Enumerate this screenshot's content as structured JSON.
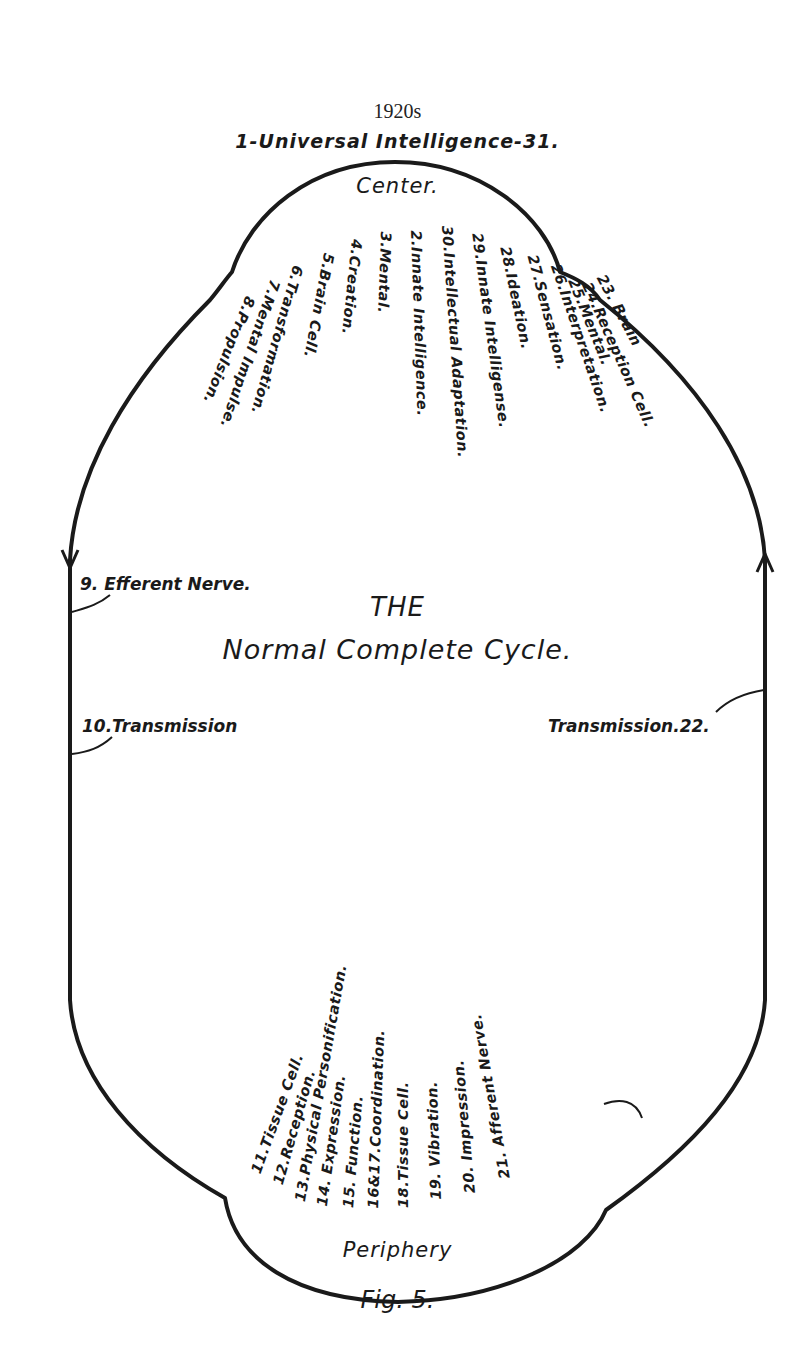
{
  "year_caption": "1920s",
  "header": "1-Universal Intelligence-31.",
  "center_label": "Center.",
  "title_line1": "THE",
  "title_line2": "Normal Complete Cycle.",
  "periphery_label": "Periphery",
  "figure_caption": "Fig. 5.",
  "center_steps": [
    {
      "label": "23. Brain",
      "x": 608,
      "y": 272,
      "angle": 62
    },
    {
      "label": "24.Reception Cell.",
      "x": 594,
      "y": 280,
      "angle": 66
    },
    {
      "label": "25.Mental.",
      "x": 580,
      "y": 276,
      "angle": 68
    },
    {
      "label": "26.Interpretation.",
      "x": 563,
      "y": 262,
      "angle": 71
    },
    {
      "label": "27.Sensation.",
      "x": 540,
      "y": 253,
      "angle": 75
    },
    {
      "label": "28.Ideation.",
      "x": 513,
      "y": 245,
      "angle": 78
    },
    {
      "label": "29.Innate Intelligense.",
      "x": 485,
      "y": 232,
      "angle": 82
    },
    {
      "label": "30.Intellectual Adaptation.",
      "x": 455,
      "y": 225,
      "angle": 86
    },
    {
      "label": "2.Innate Intelligence.",
      "x": 424,
      "y": 230,
      "angle": 88
    },
    {
      "label": "3.Mental.",
      "x": 394,
      "y": 232,
      "angle": 92
    },
    {
      "label": "4.Creation.",
      "x": 365,
      "y": 240,
      "angle": 96
    },
    {
      "label": "5.Brain Cell.",
      "x": 337,
      "y": 255,
      "angle": 101
    },
    {
      "label": "6.Transformation.",
      "x": 306,
      "y": 268,
      "angle": 106
    },
    {
      "label": "7.Mental Impulse.",
      "x": 283,
      "y": 283,
      "angle": 109
    },
    {
      "label": "8.Propulsion.",
      "x": 258,
      "y": 300,
      "angle": 112
    }
  ],
  "side_labels": {
    "efferent": "9. Efferent Nerve.",
    "transmission_left": "10.Transmission",
    "transmission_right": "Transmission.22."
  },
  "periphery_steps": [
    {
      "label": "11.Tissue Cell.",
      "x": 248,
      "y": 1170,
      "angle": -70
    },
    {
      "label": "12.Reception.",
      "x": 270,
      "y": 1182,
      "angle": -74
    },
    {
      "label": "13.Physical Personification.",
      "x": 292,
      "y": 1200,
      "angle": -80
    },
    {
      "label": "14. Expression.",
      "x": 314,
      "y": 1205,
      "angle": -82
    },
    {
      "label": "15. Function.",
      "x": 340,
      "y": 1207,
      "angle": -85
    },
    {
      "label": "16&17.Coordination.",
      "x": 365,
      "y": 1208,
      "angle": -88
    },
    {
      "label": "18.Tissue Cell.",
      "x": 395,
      "y": 1208,
      "angle": -90
    },
    {
      "label": "19. Vibration.",
      "x": 428,
      "y": 1200,
      "angle": -92
    },
    {
      "label": "20. Impression.",
      "x": 462,
      "y": 1194,
      "angle": -95
    },
    {
      "label": "21. Afferent Nerve.",
      "x": 497,
      "y": 1180,
      "angle": -100
    }
  ],
  "colors": {
    "ink": "#1a1a1a",
    "paper": "#ffffff"
  }
}
